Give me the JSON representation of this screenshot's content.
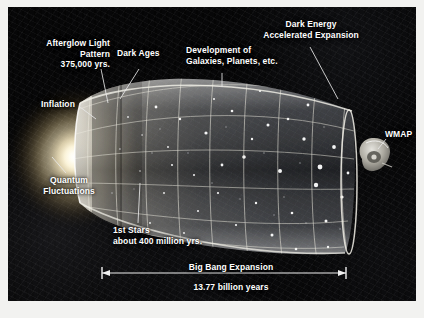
{
  "figure": {
    "frame_color": "#f2f2f0",
    "panel_color": "#070708",
    "text_color": "#ffffff"
  },
  "labels": {
    "afterglow": "Afterglow Light\nPattern\n375,000 yrs.",
    "dark_ages": "Dark Ages",
    "development": "Development of\nGalaxies, Planets, etc.",
    "dark_energy": "Dark Energy\nAccelerated Expansion",
    "inflation": "Inflation",
    "quantum": "Quantum\nFluctuations",
    "first_stars": "1st Stars\nabout 400 million yrs.",
    "wmap": "WMAP",
    "big_bang_expansion": "Big Bang Expansion",
    "duration": "13.77 billion years"
  },
  "scale_bar": {
    "label": "Big Bang Expansion",
    "value": "13.77 billion years",
    "arrow_style": "double-headed"
  },
  "icons": {
    "satellite": "wmap-satellite-icon",
    "glow": "big-bang-glow-icon",
    "cone": "expansion-cone-icon"
  }
}
